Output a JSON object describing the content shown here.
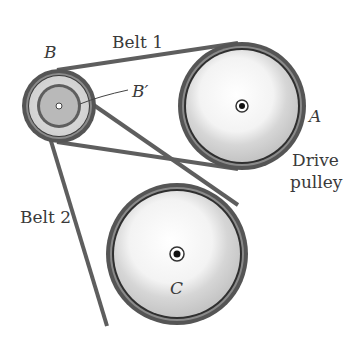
{
  "labels": {
    "belt1": "Belt 1",
    "belt2": "Belt 2",
    "pulley_a": "A",
    "pulley_b": "B",
    "pulley_b_prime": "B′",
    "pulley_c": "C",
    "drive_line1": "Drive",
    "drive_line2": "pulley"
  },
  "colors": {
    "belt": "#6a6a6a",
    "belt_dark": "#3c3c3c",
    "rim": "#c9c9c9",
    "face": "#e6e6e6",
    "hub_b_prime": "#b5b5b5",
    "text": "#3a3a3a"
  }
}
